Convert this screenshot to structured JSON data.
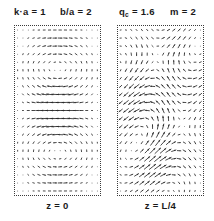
{
  "figure": {
    "background_color": "#ffffff",
    "ink_color": "#1a1a1a",
    "arrow_color": "#2b2b2b",
    "border_color": "#3a3a3a",
    "width": 214,
    "height": 221
  },
  "parameters": [
    {
      "id": "k-a",
      "text": "k·a = 1",
      "symbol": "k·a",
      "value": "1",
      "x": 14
    },
    {
      "id": "b-a",
      "text": "b/a = 2",
      "symbol": "b/a",
      "value": "2",
      "x": 60
    },
    {
      "id": "q-c",
      "text": "q_c = 1.6",
      "symbol": "q",
      "subscript": "c",
      "value": "1.6",
      "x": 119
    },
    {
      "id": "m",
      "text": "m = 2",
      "symbol": "m",
      "value": "2",
      "x": 170
    }
  ],
  "panels": [
    {
      "id": "panel-z-0",
      "caption": "z = 0",
      "box": {
        "x": 14,
        "y": 0,
        "width": 87,
        "height": 171
      },
      "grid": {
        "cols": 16,
        "rows": 21
      },
      "field_type": "quiver",
      "pattern": "double-vortex-vertical",
      "description": "Two mirror-symmetric counter-rotating cells stacked vertically; strong upward/downward jets along the vertical midline."
    },
    {
      "id": "panel-z-L4",
      "caption": "z = L/4",
      "box": {
        "x": 117,
        "y": 0,
        "width": 87,
        "height": 171
      },
      "grid": {
        "cols": 16,
        "rows": 21
      },
      "field_type": "quiver",
      "pattern": "tilted-shear-cells",
      "description": "Obliquely tilted arrow cells forming diagonal shear bands; magnitude peaks in the central band."
    }
  ],
  "captions": {
    "left": "z = 0",
    "right": "z = L/4"
  },
  "chart_data": {
    "type": "scatter",
    "title": "",
    "xlabel": "",
    "ylabel": "",
    "subplots": [
      {
        "name": "z = 0",
        "type": "quiver",
        "grid_cols": 16,
        "grid_rows": 21,
        "xlim": [
          0,
          1
        ],
        "ylim": [
          0,
          1
        ],
        "grid": false,
        "model": {
          "kind": "stream-cells",
          "cells_x": 1,
          "cells_y": 2,
          "phase_x": 0.0,
          "phase_y": 0.0,
          "tilt_deg": 0,
          "amplitude": 1.0,
          "edge_falloff": 0.45,
          "center_boost": 1.35
        }
      },
      {
        "name": "z = L/4",
        "type": "quiver",
        "grid_cols": 16,
        "grid_rows": 21,
        "xlim": [
          0,
          1
        ],
        "ylim": [
          0,
          1
        ],
        "grid": false,
        "model": {
          "kind": "stream-cells",
          "cells_x": 1,
          "cells_y": 2,
          "phase_x": 0.35,
          "phase_y": 0.28,
          "tilt_deg": 38,
          "amplitude": 1.0,
          "edge_falloff": 0.35,
          "center_boost": 1.15
        }
      }
    ]
  }
}
